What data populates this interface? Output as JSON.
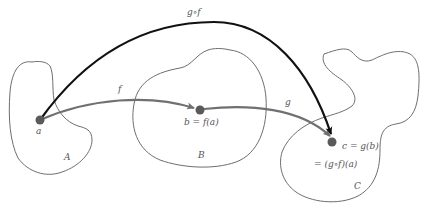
{
  "colors": {
    "background": "#ffffff",
    "region_outline": "#6e6e6e",
    "arrow_f": "#707070",
    "arrow_g": "#707070",
    "arrow_composite": "#111111",
    "point": "#5a5a5a",
    "label": "#555555"
  },
  "regions": [
    {
      "id": "A",
      "label": "A"
    },
    {
      "id": "B",
      "label": "B"
    },
    {
      "id": "C",
      "label": "C"
    }
  ],
  "points": [
    {
      "id": "a",
      "label": "a"
    },
    {
      "id": "b",
      "label": "b = f(a)"
    },
    {
      "id": "c",
      "label": "c = g(b)",
      "label2": "= (g∘f)(a)"
    }
  ],
  "arrows": [
    {
      "id": "f",
      "label": "f",
      "from": "a",
      "to": "b"
    },
    {
      "id": "g",
      "label": "g",
      "from": "b",
      "to": "c"
    },
    {
      "id": "composite",
      "label": "g∘f",
      "from": "a",
      "to": "c"
    }
  ]
}
